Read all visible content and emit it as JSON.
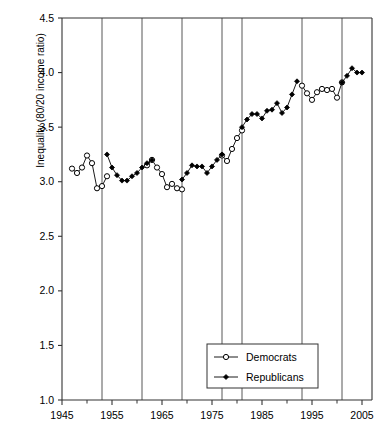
{
  "chart_data": {
    "type": "line",
    "title": "",
    "xlabel": "",
    "ylabel": "Inequality (80/20 income ratio)",
    "xlim": [
      1945,
      2007
    ],
    "ylim": [
      1.0,
      4.5
    ],
    "grid": "vertical-only",
    "legend_position": "bottom-center",
    "y_ticks": [
      "1.0",
      "1.5",
      "2.0",
      "2.5",
      "3.0",
      "3.5",
      "4.0",
      "4.5"
    ],
    "y_tick_values": [
      1.0,
      1.5,
      2.0,
      2.5,
      3.0,
      3.5,
      4.0,
      4.5
    ],
    "x_ticks": [
      "1945",
      "1955",
      "1965",
      "1975",
      "1985",
      "1995",
      "2005"
    ],
    "x_tick_values": [
      1945,
      1955,
      1965,
      1975,
      1985,
      1995,
      2005
    ],
    "x_minor_tick_values": [
      1950,
      1960,
      1970,
      1980,
      1990,
      2000
    ],
    "administration_change_years": [
      1953,
      1961,
      1969,
      1977,
      1981,
      1993,
      2001
    ],
    "series": [
      {
        "name": "Democrats",
        "marker": "open-circle",
        "color": "#000000",
        "points": [
          [
            1947,
            3.12
          ],
          [
            1948,
            3.08
          ],
          [
            1949,
            3.13
          ],
          [
            1950,
            3.24
          ],
          [
            1951,
            3.17
          ],
          [
            1952,
            2.94
          ],
          [
            1953,
            2.96
          ],
          [
            1954,
            3.05
          ],
          [
            1962,
            3.15
          ],
          [
            1963,
            3.2
          ],
          [
            1964,
            3.13
          ],
          [
            1965,
            3.07
          ],
          [
            1966,
            2.95
          ],
          [
            1967,
            2.98
          ],
          [
            1968,
            2.94
          ],
          [
            1969,
            2.93
          ],
          [
            1977,
            3.24
          ],
          [
            1978,
            3.19
          ],
          [
            1979,
            3.3
          ],
          [
            1980,
            3.4
          ],
          [
            1981,
            3.47
          ],
          [
            1993,
            3.88
          ],
          [
            1994,
            3.81
          ],
          [
            1995,
            3.75
          ],
          [
            1996,
            3.82
          ],
          [
            1997,
            3.85
          ],
          [
            1998,
            3.84
          ],
          [
            1999,
            3.85
          ],
          [
            2000,
            3.77
          ],
          [
            2001,
            3.91
          ]
        ]
      },
      {
        "name": "Republicans",
        "marker": "filled-diamond",
        "color": "#000000",
        "points": [
          [
            1954,
            3.25
          ],
          [
            1955,
            3.13
          ],
          [
            1956,
            3.06
          ],
          [
            1957,
            3.01
          ],
          [
            1958,
            3.01
          ],
          [
            1959,
            3.05
          ],
          [
            1960,
            3.08
          ],
          [
            1961,
            3.13
          ],
          [
            1962,
            3.17
          ],
          [
            1963,
            3.2
          ],
          [
            1969,
            3.02
          ],
          [
            1970,
            3.08
          ],
          [
            1971,
            3.15
          ],
          [
            1972,
            3.14
          ],
          [
            1973,
            3.14
          ],
          [
            1974,
            3.08
          ],
          [
            1975,
            3.14
          ],
          [
            1976,
            3.2
          ],
          [
            1977,
            3.25
          ],
          [
            1981,
            3.5
          ],
          [
            1982,
            3.57
          ],
          [
            1983,
            3.62
          ],
          [
            1984,
            3.62
          ],
          [
            1985,
            3.58
          ],
          [
            1986,
            3.65
          ],
          [
            1987,
            3.66
          ],
          [
            1988,
            3.72
          ],
          [
            1989,
            3.63
          ],
          [
            1990,
            3.68
          ],
          [
            1991,
            3.8
          ],
          [
            1992,
            3.92
          ],
          [
            2001,
            3.91
          ],
          [
            2002,
            3.97
          ],
          [
            2003,
            4.04
          ],
          [
            2004,
            4.0
          ],
          [
            2005,
            4.0
          ]
        ]
      }
    ]
  },
  "legend": {
    "entries": [
      {
        "label": "Democrats",
        "marker": "open-circle"
      },
      {
        "label": "Republicans",
        "marker": "filled-diamond"
      }
    ]
  }
}
